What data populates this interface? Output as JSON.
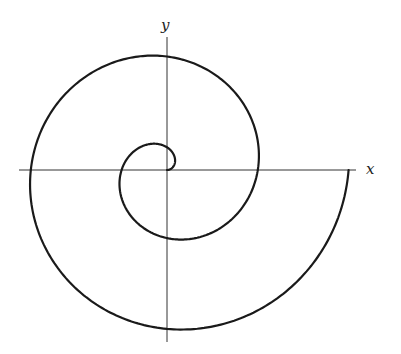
{
  "figure": {
    "type": "archimedean-spiral",
    "origin_px": [
      167,
      170
    ],
    "spiral": {
      "a_px_per_rad": 14.45,
      "theta_start": 0,
      "theta_end_turns": 2.0,
      "stroke_color": "#1a1a1a",
      "stroke_width": 2.2
    },
    "axes": {
      "x": {
        "label": "x",
        "from_px": 19,
        "to_px": 356
      },
      "y": {
        "label": "y",
        "from_px": 37,
        "to_px": 342
      },
      "color": "#333333"
    }
  }
}
